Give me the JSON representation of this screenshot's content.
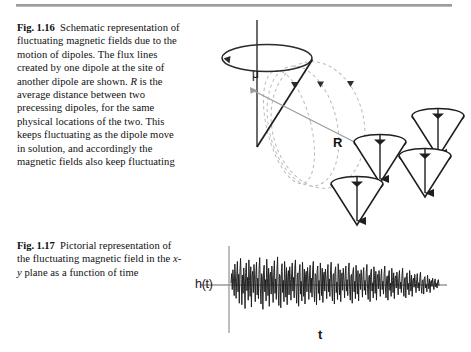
{
  "page": {
    "width": 471,
    "height": 352,
    "background": "#ffffff",
    "divider_color": "#9a9a9a"
  },
  "captions": [
    {
      "id": "fig-1-16",
      "label": "Fig. 1.16",
      "text": "Schematic representation of fluctuating magnetic fields due to the motion of dipoles. The flux lines created by one dipole at the site of another dipole are shown. R is the average distance between two precessing dipoles, for the same physical locations of the two. This keeps fluctuating as the dipole move in solution, and accordingly the magnetic fields also keep fluctuating",
      "italic_terms": [
        "R"
      ]
    },
    {
      "id": "fig-1-17",
      "label": "Fig. 1.17",
      "text": "Pictorial representation of the fluctuating magnetic field in the x-y plane as a function of time",
      "italic_terms": [
        "x-y"
      ]
    }
  ],
  "figures": {
    "dipole_schematic": {
      "name": "dipole-precession-schematic",
      "annotations": {
        "magnetic_moment_symbol": "μ",
        "distance_symbol": "R"
      },
      "elements": {
        "precession_axis": "vertical-line",
        "precession_cone_count": 1,
        "flux_loop_count": 3,
        "flux_arrow_count": 3,
        "dipole_cone_count": 4,
        "circulation_arrow": true
      },
      "colors": {
        "solid_stroke": "#2b2b2b",
        "dashed_flux": "#b7b7b7",
        "distance_line": "#9e9e9e",
        "cone_fill": "#ffffff"
      }
    },
    "waveform": {
      "name": "fluctuating-field-waveform",
      "y_axis_label": "h(t)",
      "x_axis_label": "t",
      "colors": {
        "trace": "#1c1c1c",
        "axis": "#9a9a9a"
      },
      "axis": {
        "x_origin": 41,
        "y_origin": 47,
        "x_end": 259,
        "y_top": 8,
        "y_bottom": 95
      }
    }
  },
  "chart_data": {
    "type": "line",
    "title": "",
    "xlabel": "t",
    "ylabel": "h(t)",
    "grid": false,
    "legend": null,
    "xlim": [
      0,
      1
    ],
    "ylim": [
      -1,
      1
    ],
    "series": [
      {
        "name": "h(t)",
        "values": [
          0.05,
          0.3,
          -0.12,
          0.4,
          0.1,
          -0.28,
          0.55,
          0.18,
          -0.35,
          0.22,
          0.62,
          -0.18,
          0.28,
          -0.48,
          0.35,
          0.7,
          0.14,
          -0.52,
          0.26,
          -0.22,
          0.45,
          0.08,
          -0.62,
          0.33,
          0.58,
          -0.15,
          0.2,
          -0.4,
          0.66,
          0.12,
          -0.3,
          0.48,
          -0.58,
          0.24,
          0.36,
          -0.2,
          0.54,
          0.16,
          -0.44,
          0.28,
          0.6,
          -0.26,
          0.18,
          -0.36,
          0.42,
          0.72,
          -0.1,
          -0.5,
          0.3,
          0.22,
          -0.64,
          0.38,
          0.52,
          -0.18,
          0.14,
          -0.42,
          0.68,
          0.2,
          -0.28,
          0.44,
          -0.56,
          0.26,
          0.34,
          -0.24,
          0.5,
          0.1,
          -0.46,
          0.32,
          0.64,
          -0.22,
          0.16,
          -0.38,
          0.4,
          0.74,
          -0.14,
          -0.54,
          0.28,
          0.24,
          -0.6,
          0.36,
          0.56,
          -0.2,
          0.12,
          -0.44,
          0.62,
          0.18,
          -0.32,
          0.46,
          -0.52,
          0.22,
          0.38,
          -0.26,
          0.48,
          0.14,
          -0.4,
          0.3,
          0.58,
          -0.16,
          0.2,
          -0.34,
          0.44,
          0.66,
          -0.12,
          -0.48,
          0.26,
          0.32,
          -0.56,
          0.34,
          0.54,
          -0.24,
          0.1,
          -0.42,
          0.6,
          0.22,
          -0.3,
          0.42,
          -0.5,
          0.28,
          0.36,
          -0.18,
          0.46,
          0.16,
          -0.38,
          0.24,
          0.52,
          -0.2,
          0.18,
          -0.32,
          0.4,
          0.62,
          -0.14,
          -0.44,
          0.3,
          0.26,
          -0.52,
          0.38,
          0.5,
          -0.22,
          0.12,
          -0.4,
          0.58,
          0.2,
          -0.28,
          0.44,
          -0.46,
          0.24,
          0.34,
          -0.16,
          0.42,
          0.14,
          -0.36,
          0.28,
          0.54,
          -0.18,
          0.16,
          -0.3,
          0.38,
          0.6,
          -0.1,
          -0.42,
          0.26,
          0.3,
          -0.5,
          0.36,
          0.48,
          -0.2,
          0.08,
          -0.38,
          0.56,
          0.18,
          -0.26,
          0.4,
          -0.44,
          0.22,
          0.32,
          -0.14,
          0.44,
          0.12,
          -0.34,
          0.26,
          0.5,
          -0.16,
          0.14,
          -0.28,
          0.36,
          0.58,
          -0.12,
          -0.4,
          0.24,
          0.28,
          -0.48,
          0.34,
          0.46,
          -0.18,
          0.1,
          -0.36,
          0.52,
          0.16,
          -0.24,
          0.38,
          -0.42,
          0.2,
          0.3,
          -0.12,
          0.4,
          0.1,
          -0.32,
          0.24,
          0.46,
          -0.14,
          0.12,
          -0.26,
          0.34,
          0.54,
          -0.1,
          -0.38,
          0.22,
          0.26,
          -0.44,
          0.32,
          0.42,
          -0.16,
          0.06,
          -0.34,
          0.48,
          0.14,
          -0.22,
          0.36,
          -0.4,
          0.18,
          0.28,
          -0.1,
          0.38,
          0.08,
          -0.3,
          0.22,
          0.42,
          -0.12,
          0.1,
          -0.24,
          0.3,
          0.5,
          -0.08,
          -0.34,
          0.2,
          0.24,
          -0.4,
          0.28,
          0.38,
          -0.14,
          0.05,
          -0.3,
          0.44,
          0.12,
          -0.2,
          0.32,
          -0.36,
          0.16,
          0.24,
          -0.08,
          0.34,
          0.06,
          -0.26,
          0.18,
          0.38,
          -0.1,
          0.08,
          -0.2,
          0.26,
          0.44,
          -0.06,
          -0.3,
          0.16,
          0.2,
          -0.34,
          0.24,
          0.32,
          -0.12,
          0.04,
          -0.26,
          0.38,
          0.1,
          -0.16,
          0.26,
          -0.3,
          0.12,
          0.18,
          -0.06,
          0.28,
          0.04,
          -0.2,
          0.14,
          0.3,
          -0.08,
          0.06,
          -0.16,
          0.2,
          0.34,
          -0.04,
          -0.22,
          0.12,
          0.14,
          -0.24,
          0.18,
          0.22,
          -0.08,
          0.02,
          -0.18,
          0.26,
          0.06,
          -0.1,
          0.16,
          -0.2,
          0.08,
          0.12,
          -0.04,
          0.18,
          0.02,
          -0.12,
          0.08,
          0.16,
          -0.05,
          0.04,
          -0.08,
          0.1,
          0.14,
          -0.02
        ]
      }
    ]
  }
}
